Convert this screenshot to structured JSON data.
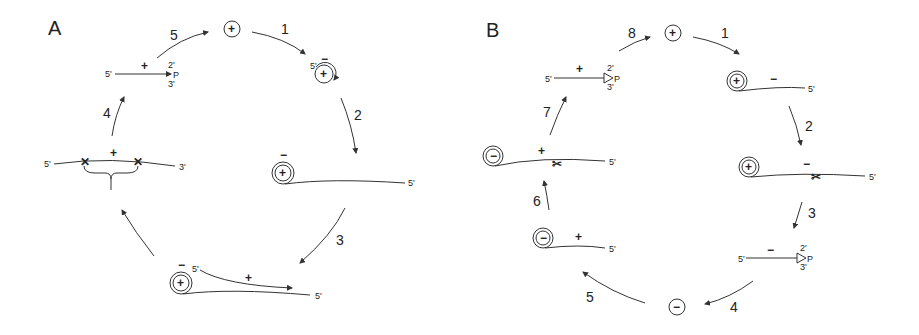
{
  "panels": [
    {
      "id": "A",
      "label": "A",
      "steps": [
        "1",
        "2",
        "3",
        "4",
        "5"
      ],
      "nodes": {
        "start_circle": "+",
        "after_step1": {
          "prime": "5'",
          "sign_outer": "−",
          "sign_inner": "+"
        },
        "after_step2": {
          "sign_outer": "−",
          "sign_inner": "+",
          "tail_end": "5'"
        },
        "after_step3": {
          "sign_outer": "−",
          "sign_inner": "+",
          "strand_top_end": "5'",
          "strand_sign": "+",
          "tail_end": "5'"
        },
        "cleavage": {
          "left_end": "5'",
          "right_end": "3'",
          "sign": "+"
        },
        "linear_product": {
          "left_end": "5'",
          "sign": "+",
          "top_mark": "2'",
          "bottom_mark": "3'",
          "terminal": "P"
        }
      }
    },
    {
      "id": "B",
      "label": "B",
      "steps": [
        "1",
        "2",
        "3",
        "4",
        "5",
        "6",
        "7",
        "8"
      ],
      "nodes": {
        "start_circle": "+",
        "after_step1": {
          "sign_inner": "+",
          "strand_sign": "−",
          "tail_end": "5'"
        },
        "after_step2": {
          "sign_inner": "+",
          "strand_sign": "−",
          "tail_end": "5'"
        },
        "linear_minus": {
          "left_end": "5'",
          "sign": "−",
          "top_mark": "2'",
          "bottom_mark": "3'",
          "terminal": "P"
        },
        "minus_circle": "−",
        "after_step5": {
          "sign_inner": "−",
          "strand_sign": "+",
          "tail_end": "5'"
        },
        "after_step6": {
          "sign_inner": "−",
          "strand_sign": "+",
          "tail_end": "5'"
        },
        "linear_plus": {
          "left_end": "5'",
          "sign": "+",
          "top_mark": "2'",
          "bottom_mark": "3'",
          "terminal": "P"
        }
      }
    }
  ]
}
